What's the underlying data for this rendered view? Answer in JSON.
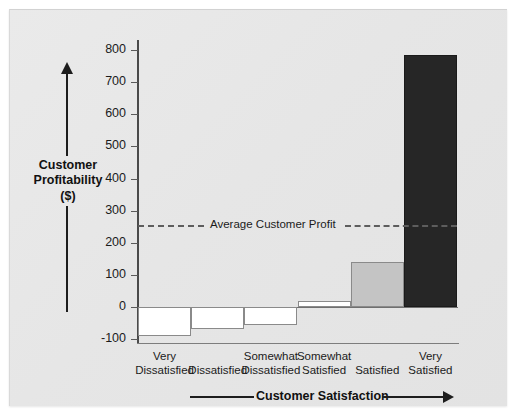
{
  "chart_data": {
    "type": "bar",
    "title": "",
    "xlabel": "Customer Satisfaction",
    "ylabel": "Customer Profitability ($)",
    "ylabel_line1": "Customer",
    "ylabel_line2": "Profitability",
    "ylabel_line3": "($)",
    "categories": [
      "Very\nDissatisfied",
      "Dissatisfied",
      "Somewhat\nDissatisfied",
      "Somewhat\nSatisfied",
      "Satisfied",
      "Very\nSatisfied"
    ],
    "category_lines": [
      [
        "Very",
        "Dissatisfied"
      ],
      [
        "",
        "Dissatisfied"
      ],
      [
        "Somewhat",
        "Dissatisfied"
      ],
      [
        "Somewhat",
        "Satisfied"
      ],
      [
        "",
        "Satisfied"
      ],
      [
        "Very",
        "Satisfied"
      ]
    ],
    "values": [
      -90,
      -70,
      -55,
      20,
      140,
      785
    ],
    "bar_colors": [
      "#ffffff",
      "#ffffff",
      "#ffffff",
      "#ffffff",
      "#c4c4c4",
      "#262626"
    ],
    "ylim": [
      -100,
      830
    ],
    "yticks": [
      800,
      700,
      600,
      500,
      400,
      300,
      200,
      100,
      0,
      -100
    ],
    "ytick_labels": [
      "800",
      "700",
      "600",
      "500",
      "400",
      "300",
      "200",
      "100",
      "0",
      "-100"
    ],
    "grid": false,
    "legend": "none",
    "annotations": [
      {
        "name": "average-customer-profit",
        "label": "Average Customer Profit",
        "value": 255,
        "style": "dashed"
      }
    ]
  },
  "colors": {
    "panel_background": "#e8e8e8",
    "axis": "#4a4a4a",
    "text": "#1b1b1b",
    "bar_dark": "#262626",
    "bar_mid": "#c4c4c4",
    "bar_light": "#ffffff",
    "dashed_line": "#5d5d5d"
  }
}
